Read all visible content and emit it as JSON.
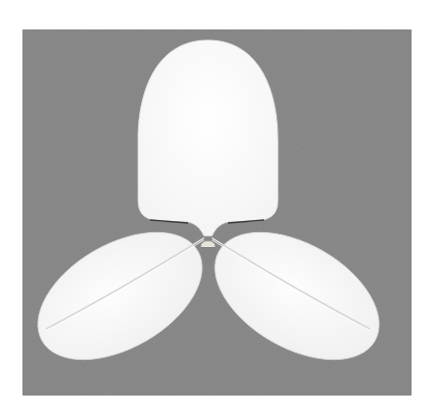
{
  "image": {
    "alt": "White three-lobed leaf-shaped paper cutout on a gray background",
    "colors": {
      "page_background": "#ffffff",
      "backdrop": "#8b8b8b",
      "backdrop_dark": "#7e7e7e",
      "leaf_fill": "#fbfbfb",
      "leaf_shade": "#ececec",
      "vein": "#dcdcdc",
      "bulb": "#e8e4dc"
    }
  }
}
